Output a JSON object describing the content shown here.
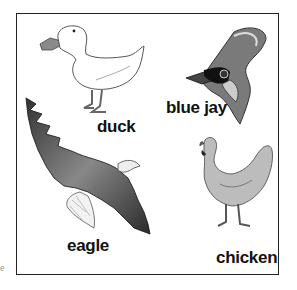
{
  "figure": {
    "labels": {
      "duck": "duck",
      "blue_jay": "blue jay",
      "eagle": "eagle",
      "chicken": "chicken"
    },
    "edge_fragment": "e"
  }
}
